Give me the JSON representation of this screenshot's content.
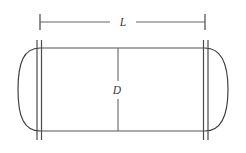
{
  "diagram": {
    "background_color": "#ffffff",
    "line_color": "#555555",
    "label_color": "#3d3d3d",
    "labels": {
      "length": "L",
      "diameter": "D"
    },
    "dimensions": {
      "length_line": {
        "label": "L",
        "orientation": "horizontal",
        "y": 22,
        "x_start": 40,
        "x_end": 205,
        "gap_start": 110,
        "gap_end": 136,
        "tick_half_height": 8
      },
      "diameter_line": {
        "label": "D",
        "orientation": "vertical",
        "x": 118,
        "y_start": 48,
        "y_end": 131,
        "gap_start": 81,
        "gap_end": 99
      }
    },
    "geometry": {
      "shell": {
        "x_left": 40,
        "x_right": 205,
        "y_top": 48,
        "y_bottom": 131
      },
      "left_head": {
        "apex_x": 18,
        "attach_x": 40,
        "y_top": 48,
        "y_bottom": 131
      },
      "right_head": {
        "apex_x": 228,
        "attach_x": 205,
        "y_top": 48,
        "y_bottom": 131
      },
      "flanges": {
        "y_top": 40,
        "y_bottom": 140,
        "left_x": [
          37,
          41.5
        ],
        "right_x": [
          203.5,
          208
        ]
      }
    }
  }
}
